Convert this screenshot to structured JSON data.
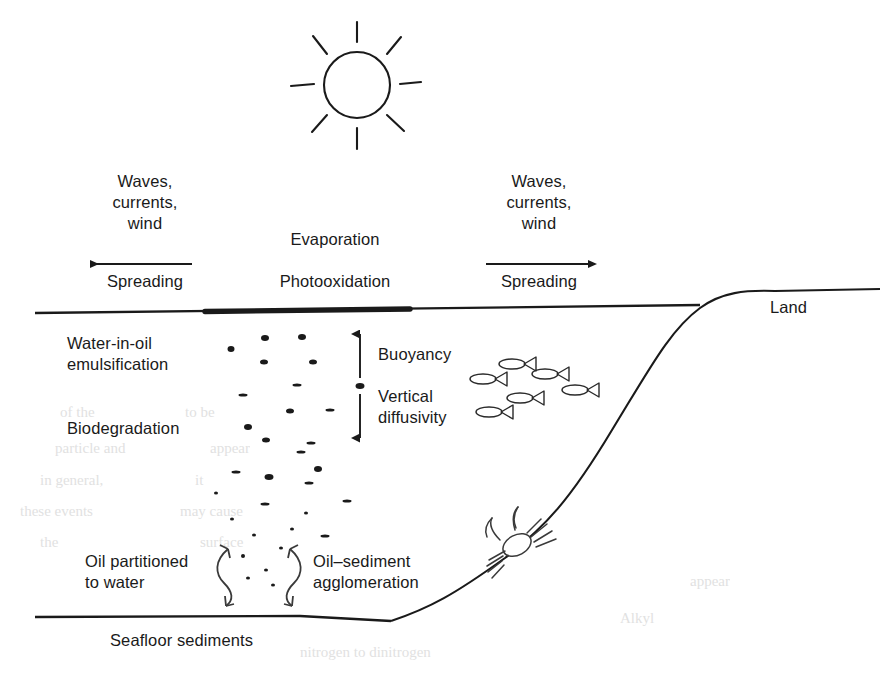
{
  "figure": {
    "domain": "diagram",
    "background_color": "#ffffff",
    "ink_color": "#1a1a1a",
    "width": 894,
    "height": 673
  },
  "labels": {
    "sun": "",
    "land": "Land",
    "evaporation": "Evaporation",
    "photooxidation": "Photooxidation",
    "left_forcing": "Waves,\ncurrents,\nwind",
    "left_spreading": "Spreading",
    "right_forcing": "Waves,\ncurrents,\nwind",
    "right_spreading": "Spreading",
    "water_in_oil": "Water-in-oil\nemulsification",
    "biodegradation": "Biodegradation",
    "buoyancy": "Buoyancy",
    "vertical_diffusivity": "Vertical\ndiffusivity",
    "oil_partitioned": "Oil partitioned\nto water",
    "oil_sediment": "Oil–sediment\nagglomeration",
    "seafloor": "Seafloor sediments"
  },
  "icons": {
    "sun": "sun-icon",
    "fish": "fish-icon",
    "crab": "crab-icon",
    "arrow_left": "arrow-left-icon",
    "arrow_right": "arrow-right-icon",
    "arrow_up": "arrow-up-icon",
    "arrow_down": "arrow-down-icon",
    "curved_arrow_left": "curved-double-arrow-left-icon",
    "curved_arrow_right": "curved-double-arrow-right-icon",
    "oil_slick": "oil-slick-icon",
    "oil_droplet": "oil-droplet-icon"
  },
  "geometry": {
    "sea_surface_y": 309,
    "sea_surface_x_start": 35,
    "sea_surface_x_end": 700,
    "seafloor_y": 614,
    "seafloor_x_start": 35,
    "seafloor_x_end": 420,
    "oil_slick_x_start": 205,
    "oil_slick_x_end": 410,
    "shoreline_top_y": 296,
    "shoreline_right_x": 880
  },
  "chart_data": {
    "type": "diagram",
    "surface_processes": [
      "Evaporation",
      "Photooxidation",
      "Spreading"
    ],
    "forcings": [
      "Waves",
      "currents",
      "wind"
    ],
    "water_column_processes": [
      "Water-in-oil emulsification",
      "Biodegradation",
      "Buoyancy",
      "Vertical diffusivity"
    ],
    "benthic_processes": [
      "Oil partitioned to water",
      "Oil-sediment agglomeration"
    ],
    "compartments": [
      "Land",
      "Sea surface",
      "Water column",
      "Seafloor sediments"
    ],
    "fauna": [
      "fish",
      "crab"
    ]
  },
  "ghost_text": [
    {
      "t": "of the",
      "x": 60,
      "y": 404,
      "s": 15
    },
    {
      "t": "to be",
      "x": 185,
      "y": 404,
      "s": 15
    },
    {
      "t": "particle and",
      "x": 55,
      "y": 440,
      "s": 15
    },
    {
      "t": "appear",
      "x": 210,
      "y": 440,
      "s": 15
    },
    {
      "t": "in general,",
      "x": 40,
      "y": 472,
      "s": 15
    },
    {
      "t": "it",
      "x": 195,
      "y": 472,
      "s": 15
    },
    {
      "t": "these events",
      "x": 20,
      "y": 503,
      "s": 15
    },
    {
      "t": "may cause",
      "x": 180,
      "y": 503,
      "s": 15
    },
    {
      "t": "the",
      "x": 40,
      "y": 534,
      "s": 15
    },
    {
      "t": "surface",
      "x": 200,
      "y": 534,
      "s": 15
    },
    {
      "t": "nitrogen to dinitrogen",
      "x": 300,
      "y": 644,
      "s": 15
    },
    {
      "t": "Alkyl",
      "x": 620,
      "y": 610,
      "s": 15
    },
    {
      "t": "appear",
      "x": 690,
      "y": 573,
      "s": 15
    }
  ],
  "droplets": [
    {
      "x": 231,
      "y": 349,
      "w": 7,
      "h": 6,
      "shape": "dot"
    },
    {
      "x": 265,
      "y": 338,
      "w": 8,
      "h": 6,
      "shape": "dot"
    },
    {
      "x": 302,
      "y": 337,
      "w": 8,
      "h": 6,
      "shape": "dot"
    },
    {
      "x": 264,
      "y": 362,
      "w": 8,
      "h": 5,
      "shape": "dot"
    },
    {
      "x": 313,
      "y": 362,
      "w": 8,
      "h": 5,
      "shape": "dot"
    },
    {
      "x": 297,
      "y": 385,
      "w": 9,
      "h": 3,
      "shape": "dash"
    },
    {
      "x": 243,
      "y": 395,
      "w": 9,
      "h": 3,
      "shape": "dash"
    },
    {
      "x": 290,
      "y": 411,
      "w": 8,
      "h": 5,
      "shape": "dot"
    },
    {
      "x": 330,
      "y": 410,
      "w": 9,
      "h": 3,
      "shape": "dash"
    },
    {
      "x": 248,
      "y": 427,
      "w": 8,
      "h": 6,
      "shape": "dot"
    },
    {
      "x": 266,
      "y": 440,
      "w": 8,
      "h": 5,
      "shape": "dot"
    },
    {
      "x": 301,
      "y": 452,
      "w": 9,
      "h": 3,
      "shape": "dash"
    },
    {
      "x": 318,
      "y": 469,
      "w": 8,
      "h": 6,
      "shape": "dot"
    },
    {
      "x": 236,
      "y": 472,
      "w": 9,
      "h": 3,
      "shape": "dash"
    },
    {
      "x": 269,
      "y": 477,
      "w": 9,
      "h": 6,
      "shape": "dot"
    },
    {
      "x": 309,
      "y": 483,
      "w": 9,
      "h": 3,
      "shape": "dash"
    },
    {
      "x": 311,
      "y": 443,
      "w": 9,
      "h": 3,
      "shape": "dash"
    },
    {
      "x": 216,
      "y": 493,
      "w": 4,
      "h": 3,
      "shape": "small"
    },
    {
      "x": 265,
      "y": 504,
      "w": 9,
      "h": 3,
      "shape": "dash"
    },
    {
      "x": 232,
      "y": 519,
      "w": 4,
      "h": 3,
      "shape": "small"
    },
    {
      "x": 306,
      "y": 513,
      "w": 4,
      "h": 3,
      "shape": "small"
    },
    {
      "x": 347,
      "y": 501,
      "w": 9,
      "h": 3,
      "shape": "dash"
    },
    {
      "x": 254,
      "y": 535,
      "w": 4,
      "h": 3,
      "shape": "small"
    },
    {
      "x": 292,
      "y": 529,
      "w": 4,
      "h": 3,
      "shape": "small"
    },
    {
      "x": 325,
      "y": 536,
      "w": 9,
      "h": 3,
      "shape": "dash"
    },
    {
      "x": 281,
      "y": 548,
      "w": 4,
      "h": 3,
      "shape": "small"
    },
    {
      "x": 243,
      "y": 556,
      "w": 4,
      "h": 4,
      "shape": "small"
    },
    {
      "x": 266,
      "y": 570,
      "w": 4,
      "h": 3,
      "shape": "small"
    },
    {
      "x": 248,
      "y": 578,
      "w": 4,
      "h": 3,
      "shape": "small"
    },
    {
      "x": 273,
      "y": 585,
      "w": 4,
      "h": 3,
      "shape": "small"
    }
  ],
  "fish_positions": [
    {
      "x": 483,
      "y": 379,
      "s": 1.0
    },
    {
      "x": 512,
      "y": 364,
      "s": 1.0
    },
    {
      "x": 545,
      "y": 374,
      "s": 1.0
    },
    {
      "x": 520,
      "y": 398,
      "s": 1.0
    },
    {
      "x": 575,
      "y": 390,
      "s": 1.0
    },
    {
      "x": 489,
      "y": 412,
      "s": 1.0
    }
  ],
  "sun_rays": 8
}
